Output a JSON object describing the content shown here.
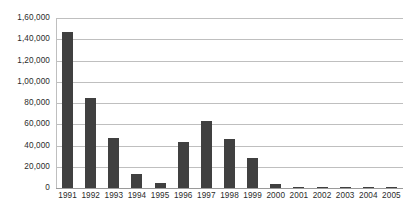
{
  "chart_data": {
    "type": "bar",
    "title": "",
    "subtitle": "",
    "xlabel": "",
    "ylabel": "",
    "legend": [],
    "legend_position": "none",
    "grid": true,
    "grid_axis": "y",
    "ylim": [
      0,
      160000
    ],
    "ytick_interval": 20000,
    "ytick_labels": [
      "0",
      "20,000",
      "40,000",
      "60,000",
      "80,000",
      "1,00,000",
      "1,20,000",
      "1,40,000",
      "1,60,000"
    ],
    "ytick_values": [
      0,
      20000,
      40000,
      60000,
      80000,
      100000,
      120000,
      140000,
      160000
    ],
    "categories": [
      "1991",
      "1992",
      "1993",
      "1994",
      "1995",
      "1996",
      "1997",
      "1998",
      "1999",
      "2000",
      "2001",
      "2002",
      "2003",
      "2004",
      "2005"
    ],
    "values": [
      147000,
      85000,
      47000,
      13000,
      4500,
      43000,
      63500,
      46000,
      28000,
      4000,
      1200,
      200,
      200,
      800,
      800
    ],
    "bar_color": "#404040",
    "gridline_color": "#bfbfbf",
    "axis_color": "#9a9a9a",
    "background_color": "#ffffff"
  }
}
